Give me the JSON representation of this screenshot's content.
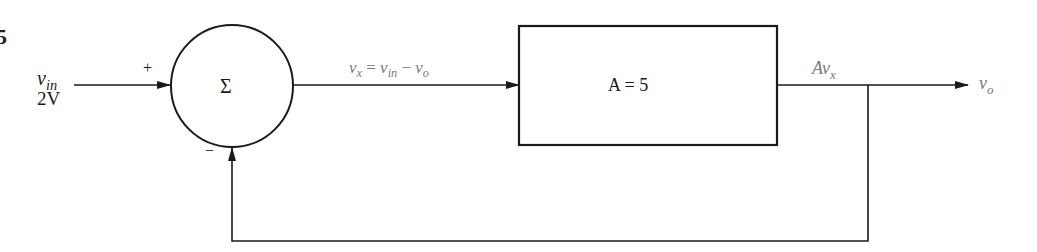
{
  "figure": {
    "number_fragment": "5"
  },
  "input": {
    "signal_name": "v",
    "signal_sub": "in",
    "value": "2V"
  },
  "summing_junction": {
    "symbol": "Σ",
    "plus_sign": "+",
    "minus_sign": "−"
  },
  "error_signal": {
    "v1": "v",
    "v1_sub": "x",
    "eq": " = ",
    "v2": "v",
    "v2_sub": "in",
    "op": " − ",
    "v3": "v",
    "v3_sub": "o"
  },
  "gain_block": {
    "label": "A = 5"
  },
  "block_output": {
    "prefix": "Av",
    "sub": "x"
  },
  "output": {
    "signal_name": "v",
    "signal_sub": "o"
  },
  "colors": {
    "line": "#1a1a1a",
    "label_gray": "#7a7a7a",
    "background": "#ffffff"
  }
}
